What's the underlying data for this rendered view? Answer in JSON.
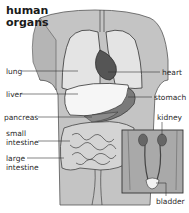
{
  "title": {
    "line1": "human",
    "line2": "organs"
  },
  "labels": {
    "lung": "lung",
    "liver": "liver",
    "pancreas": "pancreas",
    "small_intestine_1": "small",
    "small_intestine_2": "intestine",
    "large_intestine_1": "large",
    "large_intestine_2": "intestine",
    "heart": "heart",
    "stomach": "stomach",
    "kidney": "kidney",
    "bladder": "bladder"
  },
  "colors": {
    "body": "#b8b8b8",
    "body_light": "#cfcfcf",
    "lung": "#e4e4e4",
    "heart": "#555555",
    "liver": "#f4f4f4",
    "stomach": "#7a7a7a",
    "intestine": "#d8d8d8",
    "outline": "#3a3a3a",
    "inset_bg": "#a9a9a9"
  }
}
